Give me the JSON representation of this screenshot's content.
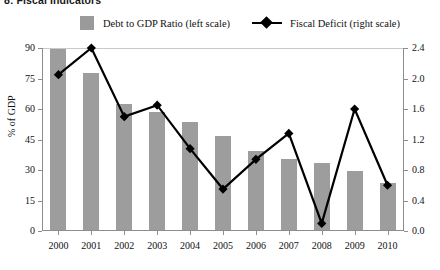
{
  "title": "8: Fiscal Indicators",
  "legend": {
    "bar_label": "Debt to GDP Ratio (left scale)",
    "line_label": "Fiscal Deficit (right scale)",
    "bar_color": "#9d9d9d",
    "line_color": "#000000"
  },
  "axis": {
    "left_title": "% of GDP",
    "left_ticks": [
      "0",
      "15",
      "30",
      "45",
      "60",
      "75",
      "90"
    ],
    "right_ticks": [
      "0.0",
      "0.4",
      "0.8",
      "1.2",
      "1.6",
      "2.0",
      "2.4"
    ]
  },
  "chart_data": {
    "type": "bar",
    "title": "8: Fiscal Indicators",
    "xlabel": "",
    "ylabel": "% of GDP",
    "ylim": [
      0,
      90
    ],
    "y2lim": [
      0.0,
      2.4
    ],
    "grid": false,
    "legend_position": "top",
    "categories": [
      "2000",
      "2001",
      "2002",
      "2003",
      "2004",
      "2005",
      "2006",
      "2007",
      "2008",
      "2009",
      "2010"
    ],
    "series": [
      {
        "name": "Debt to GDP Ratio (left scale)",
        "type": "bar",
        "axis": "left",
        "units": "% of GDP",
        "values": [
          89,
          77,
          62,
          58,
          53,
          46,
          39,
          35,
          33,
          29,
          23
        ]
      },
      {
        "name": "Fiscal Deficit (right scale)",
        "type": "line",
        "axis": "right",
        "units": "% of GDP",
        "marker": "diamond",
        "values": [
          2.05,
          2.4,
          1.5,
          1.65,
          1.08,
          0.55,
          0.94,
          1.28,
          0.1,
          1.6,
          0.6
        ]
      }
    ]
  }
}
